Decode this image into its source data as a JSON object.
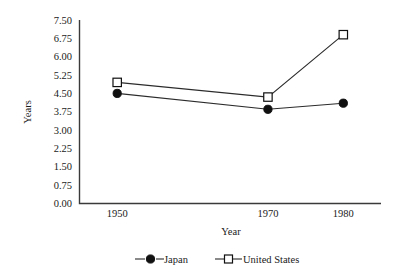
{
  "chart_data": {
    "type": "line",
    "title": "",
    "xlabel": "Year",
    "ylabel": "Years",
    "x": [
      1950,
      1970,
      1980
    ],
    "xtick_labels": [
      "1950",
      "1970",
      "1980"
    ],
    "xlim": [
      1945,
      1985
    ],
    "ylim": [
      0.0,
      7.5
    ],
    "ytick_labels": [
      "0.00",
      "0.75",
      "1.50",
      "2.25",
      "3.00",
      "3.75",
      "4.50",
      "5.25",
      "6.00",
      "6.75",
      "7.50"
    ],
    "ytick_values": [
      0.0,
      0.75,
      1.5,
      2.25,
      3.0,
      3.75,
      4.5,
      5.25,
      6.0,
      6.75,
      7.5
    ],
    "grid": false,
    "legend_position": "bottom",
    "series": [
      {
        "name": "Japan",
        "marker": "filled-circle",
        "values": [
          4.5,
          3.85,
          4.1
        ]
      },
      {
        "name": "United States",
        "marker": "open-square",
        "values": [
          4.95,
          4.35,
          6.9
        ]
      }
    ]
  },
  "legend": {
    "items": [
      {
        "label": "Japan",
        "marker": "filled-circle-marker"
      },
      {
        "label": "United States",
        "marker": "open-square-marker"
      }
    ]
  },
  "colors": {
    "line": "#2b2b2b",
    "axis": "#3a3a3a",
    "marker_fill": "#101010",
    "background": "#ffffff"
  }
}
